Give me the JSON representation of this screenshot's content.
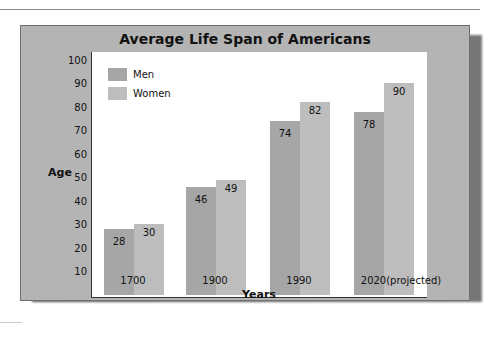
{
  "chart_data": {
    "type": "bar",
    "title": "Average Life Span of Americans",
    "xlabel": "Years",
    "ylabel": "Age",
    "categories": [
      "1700",
      "1900",
      "1990",
      "2020(projected)"
    ],
    "series": [
      {
        "name": "Men",
        "values": [
          28,
          46,
          74,
          78
        ],
        "color": "#a6a6a6"
      },
      {
        "name": "Women",
        "values": [
          30,
          49,
          82,
          90
        ],
        "color": "#bdbdbd"
      }
    ],
    "yticks": [
      10,
      20,
      30,
      40,
      50,
      60,
      70,
      80,
      90,
      100
    ],
    "ylim": [
      0,
      100
    ],
    "grid": false,
    "legend_position": "upper-left inside plot",
    "data_labels": true
  },
  "colors": {
    "frame": "#b4b4b4",
    "plot_background": "#ffffff",
    "men": "#a6a6a6",
    "women": "#bdbdbd"
  }
}
